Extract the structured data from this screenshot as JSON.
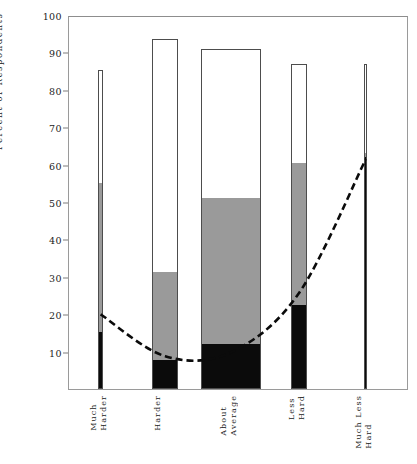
{
  "chart_data": {
    "type": "bar",
    "title": "",
    "subtitle": "",
    "xlabel": "",
    "ylabel": "Percent of Respondents",
    "ylim": [
      0,
      100
    ],
    "yticks": [
      100,
      90,
      80,
      70,
      60,
      50,
      40,
      30,
      20,
      10
    ],
    "grid": false,
    "legend": "none",
    "categories": [
      "Much Harder",
      "Harder",
      "About Average",
      "Less Hard",
      "Much Less Hard"
    ],
    "category_lines": [
      [
        "Much",
        "Harder"
      ],
      [
        "Harder",
        ""
      ],
      [
        "About",
        "Average"
      ],
      [
        "Less",
        "Hard"
      ],
      [
        "Much Less",
        "Hard"
      ]
    ],
    "stacked": true,
    "series": [
      {
        "name": "black-segment",
        "color": "#0b0b0b",
        "values": [
          15.3,
          7.7,
          12.0,
          22.5,
          62.0
        ]
      },
      {
        "name": "gray-segment",
        "color": "#9a9a9a",
        "values": [
          39.7,
          23.5,
          39.0,
          38.0,
          1.0
        ]
      },
      {
        "name": "white-segment",
        "color": "#ffffff",
        "values": [
          30.4,
          62.3,
          40.0,
          26.5,
          24.0
        ]
      }
    ],
    "bar_totals": [
      85.4,
      93.5,
      91.0,
      87.0,
      87.0
    ],
    "bar_widths_px": [
      5,
      26,
      60,
      16,
      3
    ],
    "overlay_line": {
      "name": "trend-curve",
      "style": "dashed",
      "color": "#0b0b0b",
      "x": [
        "Much Harder",
        "Harder",
        "About Average",
        "Less Hard",
        "Much Less Hard"
      ],
      "values": [
        20.5,
        9.3,
        10.3,
        26.0,
        62.0
      ]
    }
  },
  "axis": {
    "ylabel": "Percent of Respondents",
    "ticks": [
      {
        "label": "100",
        "value": 100
      },
      {
        "label": "90",
        "value": 90
      },
      {
        "label": "80",
        "value": 80
      },
      {
        "label": "70",
        "value": 70
      },
      {
        "label": "60",
        "value": 60
      },
      {
        "label": "50",
        "value": 50
      },
      {
        "label": "40",
        "value": 40
      },
      {
        "label": "30",
        "value": 30
      },
      {
        "label": "20",
        "value": 20
      },
      {
        "label": "10",
        "value": 10
      }
    ]
  },
  "caption": ""
}
